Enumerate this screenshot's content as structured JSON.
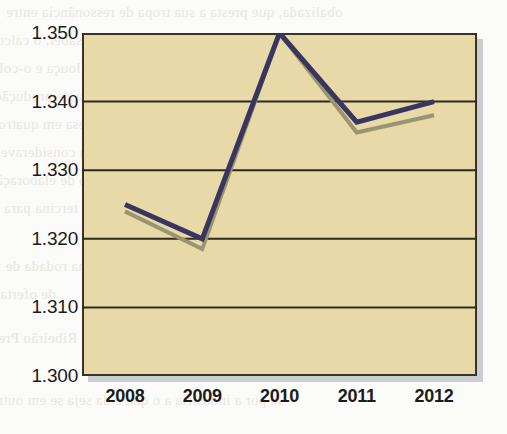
{
  "chart_data": {
    "type": "line",
    "title": "",
    "subtitle": "",
    "xlabel": "",
    "ylabel": "",
    "categories": [
      "2008",
      "2009",
      "2010",
      "2011",
      "2012"
    ],
    "x": [
      2008,
      2009,
      2010,
      2011,
      2012
    ],
    "series": [
      {
        "name": "series-navy",
        "color": "#3a3560",
        "values": [
          1.325,
          1.32,
          1.35,
          1.337,
          1.34
        ]
      },
      {
        "name": "series-olive",
        "color": "#9a9470",
        "values": [
          1.324,
          1.3185,
          1.35,
          1.3355,
          1.338
        ]
      }
    ],
    "ylim": [
      1.3,
      1.35
    ],
    "ytick_labels": [
      "1.350",
      "1.340",
      "1.330",
      "1.320",
      "1.310",
      "1.300"
    ],
    "ytick_values": [
      1.35,
      1.34,
      1.33,
      1.32,
      1.31,
      1.3
    ],
    "grid": true,
    "grid_axis": "y",
    "legend": false,
    "legend_position": "none"
  },
  "style": {
    "plot_background": "#e8d9a8",
    "page_background": "#fbfbfa",
    "frame_color": "#3a3326",
    "gridline_color": "#2e2a1e",
    "shadow_color": "#c3c4c8",
    "tick_label_color": "#1b1b1b"
  },
  "scan_bleed": {
    "lines": [
      "obalizada, que presta a sua tropa de ressonância entre",
      "ao lado de duas bacias industriais a saber, o calcos",
      "em um novo cepo a 1.1.3 os molinos de louça e o-color",
      "a inflação de produtos quimicos e a cadeia de produção",
      "de fundo e o agente, a maior parte desa em quatro re",
      "o mobiliário, a um com a anadeira a consideravel",
      "idade de tabaco industrial, o processo de elaboração",
      "quinte em tercina para o",
      "as principais doutrinas fungos da ultima rodada de fre",
      "de ofertas",
      "onde aqueles de banco de um travessão de Ribeirão Preto",
      "se por a industria a o que e da seja se em outro"
    ]
  }
}
